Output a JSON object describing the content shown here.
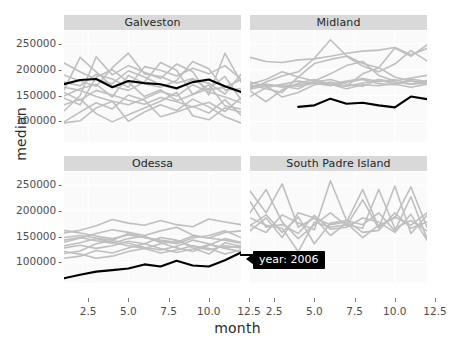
{
  "chart_data": {
    "type": "line",
    "title": "",
    "xlabel": "month",
    "ylabel": "median",
    "xlim": [
      1,
      12
    ],
    "ylim": [
      60000,
      275000
    ],
    "xticks": [
      2.5,
      5.0,
      7.5,
      10.0,
      12.5
    ],
    "xticklabels": [
      "2.5",
      "5.0",
      "7.5",
      "10.0",
      "12.5"
    ],
    "yticks": [
      100000,
      150000,
      200000,
      250000
    ],
    "yticklabels": [
      "100000",
      "150000",
      "200000",
      "250000"
    ],
    "grid": true,
    "legend": "none",
    "facet_titles": [
      "Galveston",
      "Midland",
      "Odessa",
      "South Padre Island"
    ],
    "highlight_color": "#000000",
    "background_series_color": "#bfbfbf",
    "panel_background": "#fafafa",
    "strip_background": "#d9d9d9",
    "annotation": {
      "text": "year: 2006",
      "background": "#000000",
      "color": "#ffffff"
    },
    "x": [
      1,
      2,
      3,
      4,
      5,
      6,
      7,
      8,
      9,
      10,
      11,
      12
    ],
    "panels": [
      {
        "name": "Galveston",
        "highlight_series": {
          "name": "2006",
          "values": [
            172000,
            180000,
            182000,
            166000,
            178000,
            174000,
            172000,
            164000,
            176000,
            181000,
            168000,
            157000
          ]
        },
        "series": [
          {
            "name": "bg1",
            "values": [
              145000,
              132000,
              186000,
              200000,
              176000,
              148000,
              161000,
              140000,
              152000,
              171000,
              130000,
              124000
            ]
          },
          {
            "name": "bg2",
            "values": [
              120000,
              150000,
              225000,
              190000,
              208000,
              195000,
              183000,
              211000,
              196000,
              151000,
              232000,
              176000
            ]
          },
          {
            "name": "bg3",
            "values": [
              190000,
              178000,
              168000,
              204000,
              232000,
              192000,
              187000,
              174000,
              183000,
              161000,
              166000,
              181000
            ]
          },
          {
            "name": "bg4",
            "values": [
              97000,
              101000,
              126000,
              139000,
              100000,
              118000,
              132000,
              121000,
              143000,
              128000,
              109000,
              97000
            ]
          },
          {
            "name": "bg5",
            "values": [
              161000,
              224000,
              196000,
              168000,
              160000,
              176000,
              214000,
              199000,
              152000,
              163000,
              187000,
              142000
            ]
          },
          {
            "name": "bg6",
            "values": [
              166000,
              160000,
              148000,
              139000,
              132000,
              144000,
              158000,
              149000,
              171000,
              157000,
              147000,
              136000
            ]
          },
          {
            "name": "bg7",
            "values": [
              132000,
              143000,
              115000,
              99000,
              113000,
              126000,
              139000,
              156000,
              111000,
              103000,
              126000,
              118000
            ]
          },
          {
            "name": "bg8",
            "values": [
              176000,
              169000,
              191000,
              182000,
              166000,
              206000,
              199000,
              188000,
              203000,
              192000,
              208000,
              182000
            ]
          },
          {
            "name": "bg9",
            "values": [
              149000,
              163000,
              172000,
              147000,
              189000,
              173000,
              166000,
              179000,
              216000,
              202000,
              161000,
              163000
            ]
          },
          {
            "name": "bg10",
            "values": [
              99000,
              118000,
              136000,
              124000,
              151000,
              141000,
              109000,
              118000,
              129000,
              116000,
              142000,
              112000
            ]
          },
          {
            "name": "bg11",
            "values": [
              213000,
              196000,
              181000,
              173000,
              198000,
              186000,
              171000,
              162000,
              181000,
              174000,
              153000,
              191000
            ]
          },
          {
            "name": "bg12",
            "values": [
              156000,
              141000,
              160000,
              151000,
              141000,
              133000,
              146000,
              138000,
              128000,
              137000,
              119000,
              146000
            ]
          }
        ]
      },
      {
        "name": "Midland",
        "highlight_series": {
          "name": "2006",
          "values": [
            null,
            null,
            null,
            128000,
            131000,
            144000,
            134000,
            136000,
            131000,
            127000,
            148000,
            143000
          ]
        },
        "series": [
          {
            "name": "bg1",
            "values": [
              163000,
              176000,
              188000,
              196000,
              222000,
              258000,
              227000,
              212000,
              204000,
              242000,
              226000,
              248000
            ]
          },
          {
            "name": "bg2",
            "values": [
              224000,
              216000,
              214000,
              219000,
              221000,
              226000,
              232000,
              236000,
              238000,
              243000,
              229000,
              241000
            ]
          },
          {
            "name": "bg3",
            "values": [
              171000,
              163000,
              156000,
              186000,
              212000,
              220000,
              226000,
              207000,
              196000,
              211000,
              237000,
              217000
            ]
          },
          {
            "name": "bg4",
            "values": [
              166000,
              172000,
              168000,
              163000,
              178000,
              192000,
              208000,
              216000,
              189000,
              178000,
              184000,
              189000
            ]
          },
          {
            "name": "bg5",
            "values": [
              148000,
              165000,
              172000,
              178000,
              174000,
              169000,
              176000,
              181000,
              173000,
              171000,
              182000,
              177000
            ]
          },
          {
            "name": "bg6",
            "values": [
              176000,
              168000,
              171000,
              168000,
              174000,
              172000,
              178000,
              183000,
              177000,
              181000,
              172000,
              174000
            ]
          },
          {
            "name": "bg7",
            "values": [
              168000,
              172000,
              166000,
              171000,
              176000,
              181000,
              172000,
              168000,
              181000,
              176000,
              172000,
              179000
            ]
          },
          {
            "name": "bg8",
            "values": [
              162000,
              169000,
              147000,
              156000,
              171000,
              176000,
              168000,
              174000,
              181000,
              172000,
              166000,
              172000
            ]
          },
          {
            "name": "bg9",
            "values": [
              159000,
              138000,
              161000,
              174000,
              181000,
              172000,
              163000,
              171000,
              169000,
              173000,
              178000,
              176000
            ]
          },
          {
            "name": "bg10",
            "values": [
              172000,
              181000,
              196000,
              186000,
              178000,
              171000,
              168000,
              192000,
              204000,
              186000,
              178000,
              172000
            ]
          }
        ]
      },
      {
        "name": "Odessa",
        "highlight_series": {
          "name": "2006",
          "values": [
            69000,
            76000,
            82000,
            85000,
            88000,
            96000,
            92000,
            103000,
            94000,
            92000,
            104000,
            119000
          ]
        },
        "series": [
          {
            "name": "bg1",
            "values": [
              157000,
              162000,
              171000,
              183000,
              176000,
              172000,
              181000,
              173000,
              169000,
              184000,
              178000,
              173000
            ]
          },
          {
            "name": "bg2",
            "values": [
              139000,
              147000,
              156000,
              163000,
              158000,
              152000,
              161000,
              168000,
              153000,
              147000,
              158000,
              161000
            ]
          },
          {
            "name": "bg3",
            "values": [
              148000,
              152000,
              147000,
              143000,
              156000,
              148000,
              143000,
              139000,
              151000,
              147000,
              143000,
              137000
            ]
          },
          {
            "name": "bg4",
            "values": [
              132000,
              138000,
              146000,
              139000,
              132000,
              127000,
              136000,
              142000,
              131000,
              124000,
              132000,
              128000
            ]
          },
          {
            "name": "bg5",
            "values": [
              117000,
              122000,
              136000,
              142000,
              137000,
              129000,
              124000,
              131000,
              143000,
              136000,
              127000,
              121000
            ]
          },
          {
            "name": "bg6",
            "values": [
              108000,
              112000,
              123000,
              118000,
              128000,
              136000,
              127000,
              119000,
              126000,
              134000,
              128000,
              132000
            ]
          },
          {
            "name": "bg7",
            "values": [
              162000,
              157000,
              151000,
              146000,
              153000,
              148000,
              141000,
              136000,
              147000,
              152000,
              161000,
              148000
            ]
          },
          {
            "name": "bg8",
            "values": [
              128000,
              133000,
              127000,
              132000,
              141000,
              136000,
              148000,
              143000,
              128000,
              116000,
              138000,
              131000
            ]
          },
          {
            "name": "bg9",
            "values": [
              143000,
              148000,
              142000,
              137000,
              146000,
              151000,
              138000,
              128000,
              121000,
              133000,
              146000,
              139000
            ]
          },
          {
            "name": "bg10",
            "values": [
              121000,
              116000,
              108000,
              112000,
              121000,
              127000,
              118000,
              124000,
              132000,
              127000,
              116000,
              124000
            ]
          }
        ]
      },
      {
        "name": "South Padre Island",
        "highlight_series": null,
        "series": [
          {
            "name": "bg1",
            "values": [
              238000,
              196000,
              252000,
              168000,
              186000,
              152000,
              176000,
              148000,
              172000,
              186000,
              246000,
              168000
            ]
          },
          {
            "name": "bg2",
            "values": [
              196000,
              241000,
              178000,
              146000,
              173000,
              196000,
              171000,
              221000,
              166000,
              248000,
              156000,
              191000
            ]
          },
          {
            "name": "bg3",
            "values": [
              172000,
              158000,
              192000,
              176000,
              163000,
              258000,
              181000,
              173000,
              196000,
              161000,
              227000,
              146000
            ]
          },
          {
            "name": "bg4",
            "values": [
              161000,
              186000,
              148000,
              196000,
              186000,
              173000,
              178000,
              241000,
              168000,
              188000,
              172000,
              196000
            ]
          },
          {
            "name": "bg5",
            "values": [
              186000,
              172000,
              166000,
              121000,
              178000,
              168000,
              173000,
              166000,
              241000,
              166000,
              181000,
              161000
            ]
          },
          {
            "name": "bg6",
            "values": [
              171000,
              192000,
              158000,
              188000,
              136000,
              176000,
              181000,
              158000,
              162000,
              196000,
              166000,
              178000
            ]
          },
          {
            "name": "bg7",
            "values": [
              218000,
              168000,
              173000,
              156000,
              191000,
              164000,
              168000,
              186000,
              178000,
              158000,
              193000,
              143000
            ]
          }
        ]
      }
    ]
  }
}
